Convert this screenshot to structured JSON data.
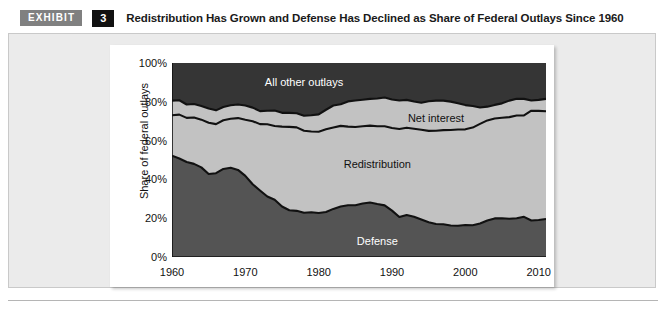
{
  "exhibit": {
    "badge_label": "EXHIBIT",
    "number": "3",
    "title": "Redistribution Has Grown and Defense Has Declined as Share of Federal Outlays Since 1960"
  },
  "colors": {
    "all_other_outlays": "#353535",
    "net_interest": "#c2c2c2",
    "redistribution": "#c2c2c2",
    "defense": "#545454",
    "separator_line": "#111111",
    "axis": "#111111",
    "panel_background": "#ebebeb",
    "chart_background": "#ffffff",
    "badge_gray": "#808080",
    "badge_black": "#111111"
  },
  "chart_data": {
    "type": "area",
    "title": "Redistribution Has Grown and Defense Has Declined as Share of Federal Outlays Since 1960",
    "xlabel": "",
    "ylabel": "Share of federal outlays",
    "ylim": [
      0,
      100
    ],
    "xlim": [
      1960,
      2011
    ],
    "grid": false,
    "legend_position": "inline-labels",
    "stacked": true,
    "y_ticks": [
      0,
      20,
      40,
      60,
      80,
      100
    ],
    "y_tick_labels": [
      "0%",
      "20%",
      "40%",
      "60%",
      "80%",
      "100%"
    ],
    "x_ticks": [
      1960,
      1970,
      1980,
      1990,
      2000,
      2010
    ],
    "x_tick_labels": [
      "1960",
      "1970",
      "1980",
      "1990",
      "2000",
      "2010"
    ],
    "x_minor_tick_interval": 1,
    "x": [
      1960,
      1961,
      1962,
      1963,
      1964,
      1965,
      1966,
      1967,
      1968,
      1969,
      1970,
      1971,
      1972,
      1973,
      1974,
      1975,
      1976,
      1977,
      1978,
      1979,
      1980,
      1981,
      1982,
      1983,
      1984,
      1985,
      1986,
      1987,
      1988,
      1989,
      1990,
      1991,
      1992,
      1993,
      1994,
      1995,
      1996,
      1997,
      1998,
      1999,
      2000,
      2001,
      2002,
      2003,
      2004,
      2005,
      2006,
      2007,
      2008,
      2009,
      2010,
      2011
    ],
    "series": [
      {
        "name": "Defense",
        "label_text": "Defense",
        "color": "#545454",
        "label_color": "#ffffff",
        "values": [
          52.2,
          50.8,
          49.0,
          48.0,
          46.2,
          42.8,
          43.2,
          45.4,
          46.0,
          44.9,
          41.8,
          37.5,
          34.3,
          31.2,
          29.5,
          26.0,
          24.1,
          23.8,
          22.8,
          23.1,
          22.7,
          23.2,
          24.8,
          26.0,
          26.7,
          26.7,
          27.6,
          28.1,
          27.3,
          26.6,
          23.9,
          20.6,
          21.6,
          20.7,
          19.3,
          17.9,
          17.0,
          16.9,
          16.2,
          16.1,
          16.5,
          16.4,
          17.3,
          18.8,
          19.9,
          20.0,
          19.7,
          20.0,
          20.7,
          18.8,
          19.1,
          19.6
        ]
      },
      {
        "name": "Redistribution",
        "label_text": "Redistribution",
        "color": "#c2c2c2",
        "label_color": "#111111",
        "values": [
          20.9,
          22.6,
          22.7,
          23.9,
          24.6,
          26.4,
          25.3,
          25.1,
          25.3,
          26.7,
          28.9,
          32.5,
          34.2,
          37.2,
          38.0,
          41.2,
          43.0,
          43.0,
          42.3,
          41.6,
          41.9,
          42.6,
          41.9,
          41.6,
          40.5,
          40.3,
          39.8,
          39.6,
          40.1,
          40.8,
          42.6,
          45.4,
          45.0,
          45.4,
          46.3,
          47.1,
          48.1,
          48.5,
          49.3,
          49.6,
          49.3,
          50.3,
          51.3,
          51.6,
          51.5,
          51.8,
          52.4,
          52.9,
          52.3,
          56.6,
          56.2,
          55.5
        ]
      },
      {
        "name": "Net interest",
        "label_text": "Net interest",
        "color": "#c2c2c2",
        "label_color": "#111111",
        "values": [
          7.5,
          7.4,
          6.9,
          7.0,
          7.0,
          7.3,
          7.1,
          6.8,
          6.9,
          7.0,
          7.4,
          7.0,
          6.7,
          7.0,
          8.0,
          7.1,
          7.2,
          7.3,
          7.7,
          8.4,
          8.9,
          10.1,
          11.4,
          11.1,
          13.0,
          13.7,
          13.7,
          13.8,
          14.3,
          14.8,
          14.7,
          14.7,
          14.4,
          14.1,
          13.9,
          15.3,
          15.5,
          15.2,
          14.6,
          13.5,
          12.5,
          11.1,
          8.5,
          7.1,
          7.0,
          7.4,
          8.5,
          8.7,
          8.5,
          5.3,
          5.7,
          6.4
        ]
      },
      {
        "name": "All other outlays",
        "label_text": "All other outlays",
        "color": "#353535",
        "label_color": "#ffffff",
        "values": [
          19.4,
          19.2,
          21.4,
          21.1,
          22.2,
          23.5,
          24.4,
          22.7,
          21.8,
          21.4,
          21.9,
          23.0,
          24.8,
          24.6,
          24.5,
          25.7,
          25.7,
          25.9,
          27.2,
          26.9,
          26.5,
          24.1,
          21.9,
          21.3,
          19.8,
          19.3,
          18.9,
          18.5,
          18.3,
          17.8,
          18.8,
          19.3,
          19.0,
          19.8,
          20.5,
          19.7,
          19.4,
          19.4,
          19.9,
          20.8,
          21.7,
          22.2,
          22.9,
          22.5,
          21.6,
          20.8,
          19.4,
          18.4,
          18.5,
          19.3,
          19.0,
          18.5
        ]
      }
    ],
    "annotations": [
      {
        "text": "All other outlays",
        "x_year": 1978,
        "y_pct": 90,
        "color": "#ffffff"
      },
      {
        "text": "Net interest",
        "x_year": 1996,
        "y_pct": 71.5,
        "color": "#111111"
      },
      {
        "text": "Redistribution",
        "x_year": 1988,
        "y_pct": 48,
        "color": "#111111"
      },
      {
        "text": "Defense",
        "x_year": 1988,
        "y_pct": 8,
        "color": "#ffffff"
      }
    ]
  }
}
